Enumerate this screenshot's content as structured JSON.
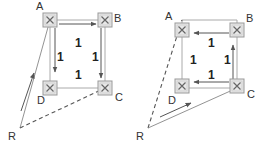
{
  "diagrams": [
    {
      "name": "left",
      "nodes": {
        "A": "A",
        "B": "B",
        "C": "C",
        "D": "D",
        "R": "R"
      },
      "link_costs": {
        "AB": "1",
        "AD": "1",
        "BC": "1",
        "DC": "1"
      },
      "traffic_arrows": [
        "A→B",
        "A→D",
        "B→C",
        "R→A"
      ],
      "dashed_link": "R–C"
    },
    {
      "name": "right",
      "nodes": {
        "A": "A",
        "B": "B",
        "C": "C",
        "D": "D",
        "R": "R"
      },
      "link_costs": {
        "AB": "1",
        "AD": "1",
        "CB": "1",
        "CD": "1"
      },
      "traffic_arrows": [
        "B→A",
        "C→B",
        "C→D",
        "R→C"
      ],
      "dashed_link": "R–A"
    }
  ],
  "colors": {
    "link": "#aaaaaa",
    "arrow": "#555555",
    "node_fill": "#e6e6e6",
    "node_border": "#999999",
    "text": "#333333"
  }
}
